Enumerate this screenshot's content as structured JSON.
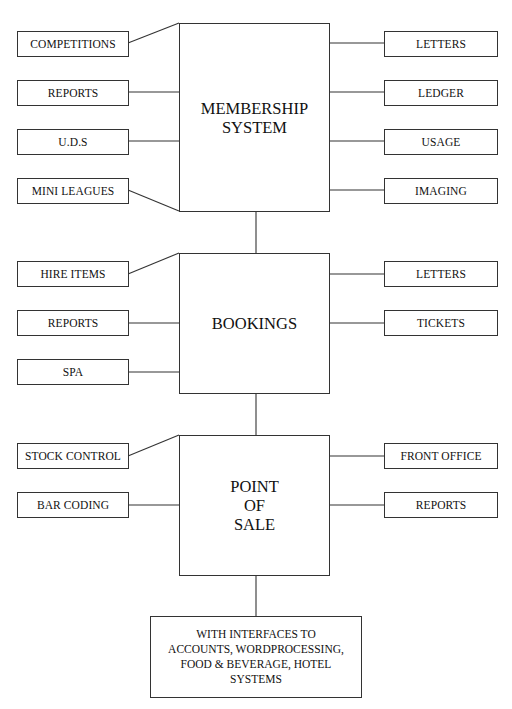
{
  "diagram": {
    "main_systems": [
      {
        "id": "membership",
        "label_lines": [
          "MEMBERSHIP",
          "SYSTEM"
        ],
        "left_modules": [
          "COMPETITIONS",
          "REPORTS",
          "U.D.S",
          "MINI LEAGUES"
        ],
        "right_modules": [
          "LETTERS",
          "LEDGER",
          "USAGE",
          "IMAGING"
        ]
      },
      {
        "id": "bookings",
        "label_lines": [
          "BOOKINGS"
        ],
        "left_modules": [
          "HIRE ITEMS",
          "REPORTS",
          "SPA"
        ],
        "right_modules": [
          "LETTERS",
          "TICKETS"
        ]
      },
      {
        "id": "pos",
        "label_lines": [
          "POINT",
          "OF",
          "SALE"
        ],
        "left_modules": [
          "STOCK CONTROL",
          "BAR CODING"
        ],
        "right_modules": [
          "FRONT OFFICE",
          "REPORTS"
        ]
      }
    ],
    "interfaces": {
      "label_lines": [
        "WITH INTERFACES TO",
        "ACCOUNTS, WORDPROCESSING,",
        "FOOD & BEVERAGE, HOTEL",
        "SYSTEMS"
      ]
    },
    "colors": {
      "line": "#333333",
      "text": "#111111",
      "background": "#ffffff"
    }
  }
}
